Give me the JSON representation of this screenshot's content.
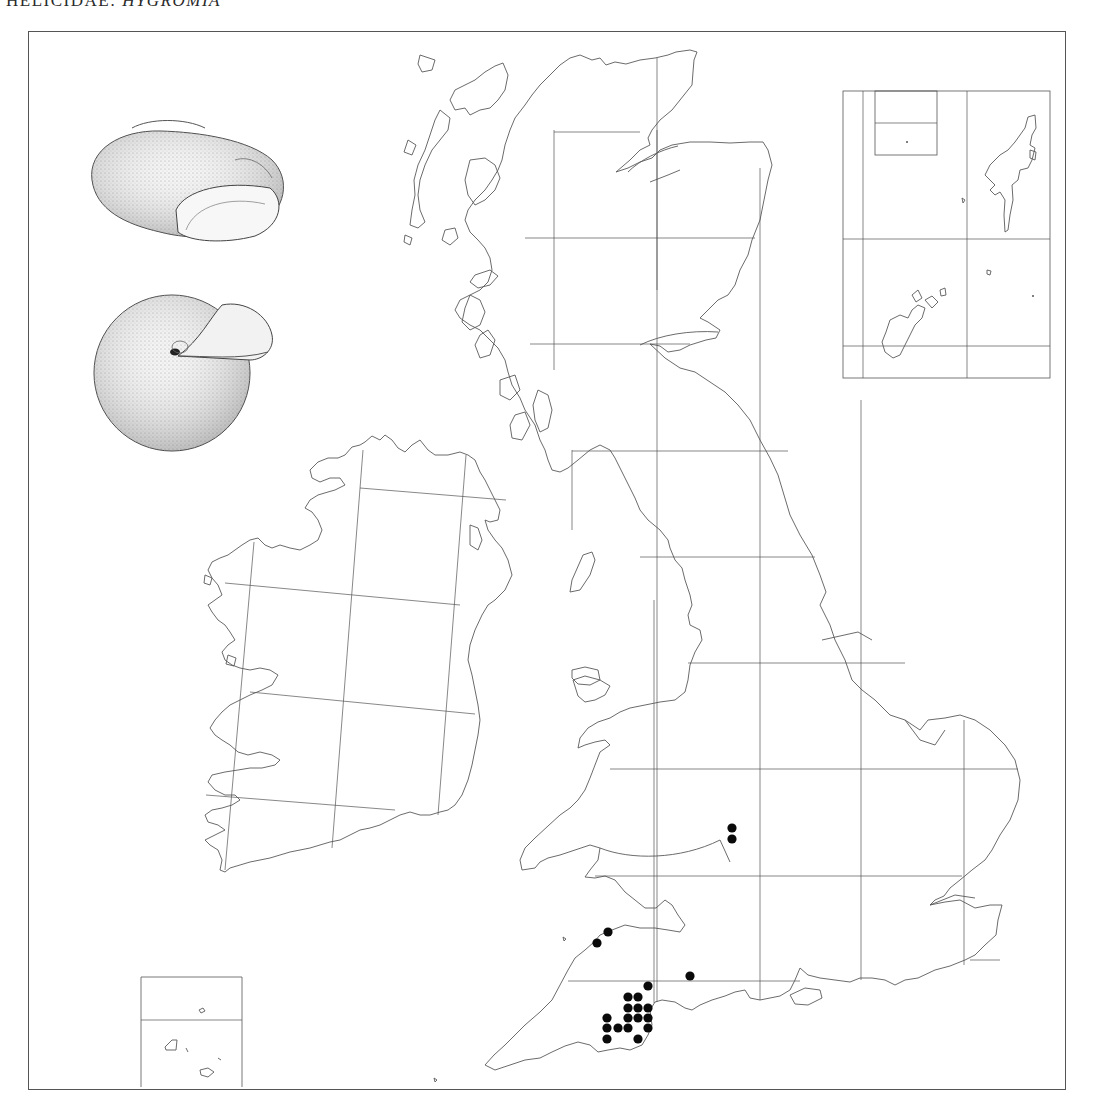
{
  "header": {
    "family": "HELICIDAE:",
    "genus": "HYGROMIA"
  },
  "map": {
    "title": "Distribution map of Hygromia (British Isles, 10 km grid)",
    "frame": {
      "left": 28,
      "top": 31,
      "right": 1066,
      "bottom": 1090
    },
    "colors": {
      "coast": "#5a5a5a",
      "grid": "#555555",
      "dot": "#0a0a0a",
      "background": "#ffffff"
    },
    "insets": [
      {
        "name": "shetland-orkney-inset",
        "label": "Orkney & Shetland inset",
        "x": 843,
        "y": 91,
        "w": 207,
        "h": 287
      },
      {
        "name": "channel-islands-inset",
        "label": "Channel Islands inset",
        "x": 141,
        "y": 977,
        "w": 101,
        "h": 110
      }
    ],
    "illustrations": [
      {
        "name": "shell-side-view",
        "label": "Shell, apertural/side view"
      },
      {
        "name": "shell-umbilical-view",
        "label": "Shell, umbilical view"
      }
    ],
    "records": [
      {
        "x": 732,
        "y": 828
      },
      {
        "x": 732,
        "y": 839
      },
      {
        "x": 608,
        "y": 932
      },
      {
        "x": 597,
        "y": 943
      },
      {
        "x": 690,
        "y": 976
      },
      {
        "x": 648,
        "y": 986
      },
      {
        "x": 628,
        "y": 997
      },
      {
        "x": 638,
        "y": 997
      },
      {
        "x": 628,
        "y": 1008
      },
      {
        "x": 638,
        "y": 1008
      },
      {
        "x": 648,
        "y": 1008
      },
      {
        "x": 607,
        "y": 1018
      },
      {
        "x": 628,
        "y": 1018
      },
      {
        "x": 638,
        "y": 1018
      },
      {
        "x": 648,
        "y": 1018
      },
      {
        "x": 607,
        "y": 1028
      },
      {
        "x": 618,
        "y": 1028
      },
      {
        "x": 628,
        "y": 1028
      },
      {
        "x": 648,
        "y": 1028
      },
      {
        "x": 607,
        "y": 1039
      },
      {
        "x": 638,
        "y": 1039
      }
    ],
    "record_count": 21
  }
}
